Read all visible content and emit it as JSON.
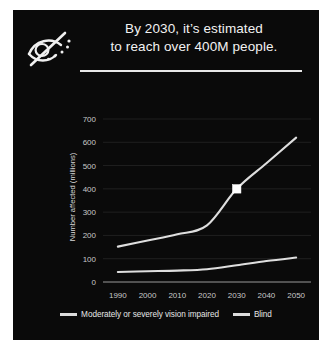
{
  "card": {
    "background_color": "#0a0a0a",
    "icon": "eye-slash-icon",
    "title_line1": "By 2030, it’s estimated",
    "title_line2": "to reach over 400M people.",
    "divider_color": "#e8e8e8"
  },
  "legend": {
    "position": "bottom-center",
    "items": [
      {
        "label": "Moderately or severely vision impaired",
        "color": "#dedede"
      },
      {
        "label": "Blind",
        "color": "#dedede"
      }
    ]
  },
  "chart_data": {
    "type": "line",
    "title": "By 2030, it’s estimated to reach over 400M people.",
    "xlabel": "Year",
    "ylabel": "Number affected (millions)",
    "x": [
      1990,
      2000,
      2010,
      2020,
      2030,
      2040,
      2050
    ],
    "xlim": [
      1985,
      2055
    ],
    "ylim": [
      0,
      730
    ],
    "xticks": [
      "1990",
      "2000",
      "2010",
      "2020",
      "2030",
      "2040",
      "2050"
    ],
    "yticks": [
      "0",
      "100",
      "200",
      "300",
      "400",
      "500",
      "600",
      "700"
    ],
    "ytick_values": [
      0,
      100,
      200,
      300,
      400,
      500,
      600,
      700
    ],
    "grid": true,
    "line_color": "#dedede",
    "series": [
      {
        "name": "Moderately or severely vision impaired",
        "values": [
          152,
          178,
          205,
          243,
          400,
          510,
          620
        ]
      },
      {
        "name": "Blind",
        "values": [
          43,
          46,
          49,
          55,
          72,
          90,
          105
        ]
      }
    ],
    "annotations": [
      {
        "name": "highlight-marker",
        "series": "Moderately or severely vision impaired",
        "x": 2030,
        "y": 400,
        "shape": "square",
        "color": "#ffffff"
      }
    ]
  }
}
